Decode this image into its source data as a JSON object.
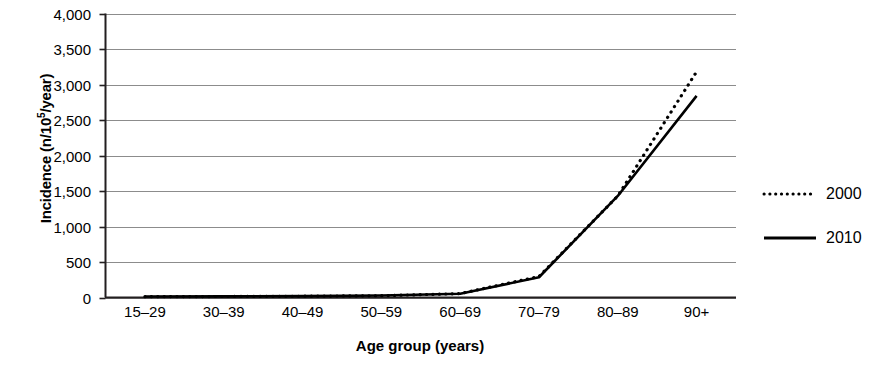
{
  "chart_data": {
    "type": "line",
    "title": "",
    "xlabel": "Age group (years)",
    "ylabel": "Incidence (n/10⁵/year)",
    "ylabel_base": "Incidence (n/10",
    "ylabel_sup": "5",
    "ylabel_tail": "/year)",
    "categories": [
      "15–29",
      "30–39",
      "40–49",
      "50–59",
      "60–69",
      "70–79",
      "80–89",
      "90+"
    ],
    "ylim": [
      0,
      4000
    ],
    "yticks": [
      4000,
      3500,
      3000,
      2500,
      2000,
      1500,
      1000,
      500,
      0
    ],
    "ytick_labels": [
      "4,000",
      "3,500",
      "3,000",
      "2,500",
      "2,000",
      "1,500",
      "1,000",
      "500",
      "0"
    ],
    "grid": true,
    "grid_axis": "y",
    "legend_position": "right",
    "series": [
      {
        "name": "2000",
        "style": "dotted",
        "color": "#000000",
        "values": [
          12,
          14,
          18,
          25,
          55,
          295,
          1430,
          3180
        ]
      },
      {
        "name": "2010",
        "style": "solid",
        "color": "#000000",
        "values": [
          14,
          16,
          20,
          28,
          52,
          285,
          1430,
          2840
        ]
      }
    ]
  },
  "legend": {
    "items": [
      {
        "label": "2000",
        "style": "dotted"
      },
      {
        "label": "2010",
        "style": "solid"
      }
    ]
  },
  "colors": {
    "axis": "#231f20",
    "grid": "#8c8c8c",
    "series": "#000000",
    "background": "#ffffff"
  }
}
